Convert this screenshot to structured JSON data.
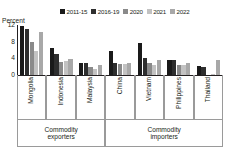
{
  "chart_data": {
    "type": "bar",
    "title": "",
    "subtitle": "",
    "xlabel": "",
    "ylabel": "Percent",
    "ylim": [
      0,
      12
    ],
    "yticks": [
      0,
      4,
      8,
      12
    ],
    "ytick_labels": [
      "0",
      "4",
      "8",
      "12"
    ],
    "grid": false,
    "legend_position": "top-right",
    "categories": [
      "Mongolia",
      "Indonesia",
      "Malaysia",
      "China",
      "Vietnam",
      "Philippines",
      "Thailand"
    ],
    "series": [
      {
        "name": "2011-15",
        "color": "#1a1a1a",
        "values": [
          11.8,
          6.6,
          2.9,
          5.8,
          7.6,
          3.7,
          2.2
        ]
      },
      {
        "name": "2016-19",
        "color": "#2e2e2e",
        "values": [
          11.0,
          5.1,
          2.9,
          2.9,
          4.2,
          3.5,
          1.9
        ]
      },
      {
        "name": "2020",
        "color": "#8a8a8a",
        "values": [
          7.9,
          3.2,
          1.9,
          2.6,
          2.9,
          2.4,
          0.0
        ]
      },
      {
        "name": "2021",
        "color": "#c2c2c2",
        "values": [
          5.8,
          3.3,
          1.5,
          2.7,
          2.5,
          2.3,
          0.3
        ]
      },
      {
        "name": "2022",
        "color": "#a8a8a8",
        "values": [
          10.3,
          3.9,
          2.3,
          2.8,
          3.5,
          2.9,
          3.6
        ]
      }
    ],
    "panels": [
      {
        "line1": "Commodity",
        "line2": "exporters",
        "categories": [
          "Mongolia",
          "Indonesia",
          "Malaysia"
        ]
      },
      {
        "line1": "Commodity",
        "line2": "importers",
        "categories": [
          "China",
          "Vietnam",
          "Philippines",
          "Thailand"
        ]
      }
    ]
  },
  "legend": {
    "items": [
      {
        "label": "2011-15",
        "color": "#1a1a1a"
      },
      {
        "label": "2016-19",
        "color": "#2e2e2e"
      },
      {
        "label": "2020",
        "color": "#8a8a8a"
      },
      {
        "label": "2021",
        "color": "#c2c2c2"
      },
      {
        "label": "2022",
        "color": "#a8a8a8"
      }
    ]
  },
  "axis": {
    "y_title": "Percent"
  }
}
